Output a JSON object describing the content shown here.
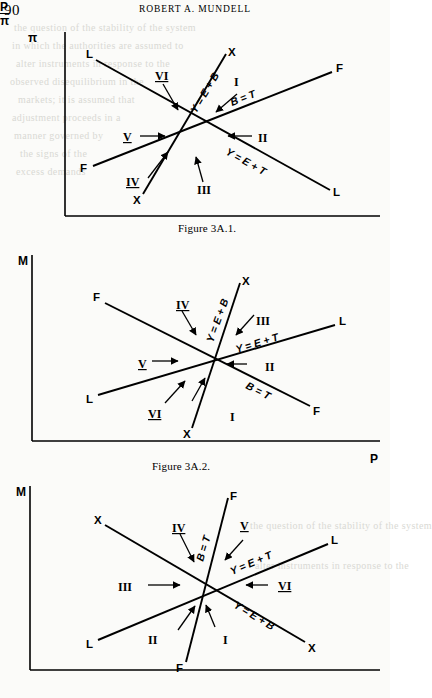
{
  "page": {
    "number": "90",
    "running_head": "ROBERT A. MUNDELL",
    "background_color": "#fbfbf9",
    "ink_color": "#000000"
  },
  "bleed_text": [
    "the question of the stability of the system",
    "in which the authorities are assumed to",
    "alter instruments in response to the",
    "observed disequilibrium in the",
    "markets; it is assumed that",
    "adjustment proceeds in a",
    "manner governed by",
    "the signs of the",
    "excess demands"
  ],
  "figures": [
    {
      "id": "figure-3a-1",
      "caption": "Figure 3A.1.",
      "y_axis_label": "π",
      "x_axis_label": "P",
      "x_axis_overbar": true,
      "lines": [
        {
          "name": "XX",
          "equation": "Y = E + B",
          "end_labels": [
            "X",
            "X"
          ],
          "slope": "steep-positive"
        },
        {
          "name": "FF",
          "equation": "B = T",
          "end_labels": [
            "F",
            "F"
          ],
          "slope": "shallow-positive"
        },
        {
          "name": "LL",
          "equation": "Y = E + T",
          "end_labels": [
            "L",
            "L"
          ],
          "slope": "negative"
        }
      ],
      "regions": [
        "I",
        "II",
        "III",
        "IV",
        "V",
        "VI"
      ]
    },
    {
      "id": "figure-3a-2",
      "caption": "Figure 3A.2.",
      "y_axis_label": "M",
      "x_axis_label": "P",
      "x_axis_overbar": false,
      "lines": [
        {
          "name": "XX",
          "equation": "Y = E + B",
          "end_labels": [
            "X",
            "X"
          ],
          "slope": "steep-positive"
        },
        {
          "name": "LL",
          "equation": "Y = E + T",
          "end_labels": [
            "L",
            "L"
          ],
          "slope": "shallow-positive"
        },
        {
          "name": "FF",
          "equation": "B = T",
          "end_labels": [
            "F",
            "F"
          ],
          "slope": "negative"
        }
      ],
      "regions": [
        "I",
        "II",
        "III",
        "IV",
        "V",
        "VI"
      ]
    },
    {
      "id": "figure-3a-3",
      "caption": "Figure 3A.3.",
      "y_axis_label": "M",
      "x_axis_label": "π",
      "x_axis_overbar": true,
      "lines": [
        {
          "name": "FF",
          "equation": "B = T",
          "end_labels": [
            "F",
            "F"
          ],
          "slope": "steep-positive"
        },
        {
          "name": "LL",
          "equation": "Y = E + T",
          "end_labels": [
            "L",
            "L"
          ],
          "slope": "shallow-positive"
        },
        {
          "name": "XX",
          "equation": "Y = E + B",
          "end_labels": [
            "X",
            "X"
          ],
          "slope": "negative"
        }
      ],
      "regions": [
        "I",
        "II",
        "III",
        "IV",
        "V",
        "VI"
      ]
    }
  ]
}
